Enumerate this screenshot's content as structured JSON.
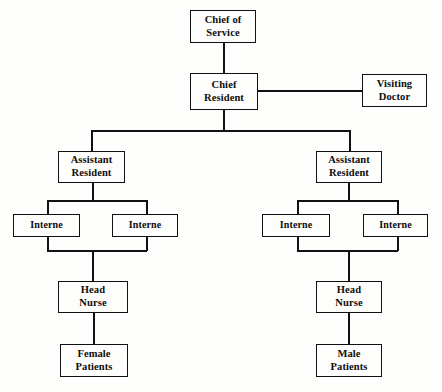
{
  "diagram": {
    "type": "org-chart",
    "canvas": {
      "width": 442,
      "height": 392
    },
    "line_color": "#111111",
    "box_fill": "#fdfdfb",
    "text_color": "#0d0d0d",
    "nodes": [
      {
        "id": "chief-of-service",
        "lines": [
          "Chief of",
          "Service"
        ],
        "x": 190,
        "y": 10,
        "w": 66,
        "h": 33
      },
      {
        "id": "chief-resident",
        "lines": [
          "Chief",
          "Resident"
        ],
        "x": 190,
        "y": 73,
        "w": 68,
        "h": 37
      },
      {
        "id": "visiting-doctor",
        "lines": [
          "Visiting",
          "Doctor"
        ],
        "x": 362,
        "y": 74,
        "w": 65,
        "h": 33
      },
      {
        "id": "assistant-resident-left",
        "lines": [
          "Assistant",
          "Resident"
        ],
        "x": 58,
        "y": 151,
        "w": 67,
        "h": 32
      },
      {
        "id": "assistant-resident-right",
        "lines": [
          "Assistant",
          "Resident"
        ],
        "x": 316,
        "y": 151,
        "w": 66,
        "h": 32
      },
      {
        "id": "interne-left-1",
        "lines": [
          "Interne"
        ],
        "x": 13,
        "y": 214,
        "w": 67,
        "h": 23
      },
      {
        "id": "interne-left-2",
        "lines": [
          "Interne"
        ],
        "x": 112,
        "y": 214,
        "w": 66,
        "h": 23
      },
      {
        "id": "interne-right-1",
        "lines": [
          "Interne"
        ],
        "x": 262,
        "y": 214,
        "w": 68,
        "h": 23
      },
      {
        "id": "interne-right-2",
        "lines": [
          "Interne"
        ],
        "x": 363,
        "y": 214,
        "w": 65,
        "h": 23
      },
      {
        "id": "head-nurse-left",
        "lines": [
          "Head",
          "Nurse"
        ],
        "x": 58,
        "y": 281,
        "w": 70,
        "h": 32
      },
      {
        "id": "head-nurse-right",
        "lines": [
          "Head",
          "Nurse"
        ],
        "x": 316,
        "y": 281,
        "w": 66,
        "h": 32
      },
      {
        "id": "female-patients",
        "lines": [
          "Female",
          "Patients"
        ],
        "x": 60,
        "y": 344,
        "w": 68,
        "h": 33
      },
      {
        "id": "male-patients",
        "lines": [
          "Male",
          "Patients"
        ],
        "x": 316,
        "y": 344,
        "w": 66,
        "h": 33
      }
    ],
    "edges": [
      {
        "id": "chief-service-to-chief-resident",
        "orient": "v",
        "x": 223,
        "y": 43,
        "len": 30
      },
      {
        "id": "chief-resident-to-visiting-doctor",
        "orient": "h",
        "x": 258,
        "y": 90,
        "len": 104
      },
      {
        "id": "chief-resident-stem-down",
        "orient": "v",
        "x": 223,
        "y": 110,
        "len": 21
      },
      {
        "id": "assistant-bus",
        "orient": "h",
        "x": 91,
        "y": 130,
        "len": 259
      },
      {
        "id": "assistant-left-drop",
        "orient": "v",
        "x": 91,
        "y": 130,
        "len": 21
      },
      {
        "id": "assistant-right-drop",
        "orient": "v",
        "x": 349,
        "y": 130,
        "len": 21
      },
      {
        "id": "assistant-left-stem",
        "orient": "v",
        "x": 92,
        "y": 183,
        "len": 18
      },
      {
        "id": "interne-left-top-bus",
        "orient": "h",
        "x": 47,
        "y": 200,
        "len": 100
      },
      {
        "id": "interne-left-1-drop",
        "orient": "v",
        "x": 47,
        "y": 200,
        "len": 15
      },
      {
        "id": "interne-left-2-drop",
        "orient": "v",
        "x": 146,
        "y": 200,
        "len": 15
      },
      {
        "id": "interne-left-1-riser",
        "orient": "v",
        "x": 47,
        "y": 237,
        "len": 14
      },
      {
        "id": "interne-left-2-riser",
        "orient": "v",
        "x": 146,
        "y": 237,
        "len": 14
      },
      {
        "id": "interne-left-bottom-bus",
        "orient": "h",
        "x": 47,
        "y": 250,
        "len": 100
      },
      {
        "id": "head-nurse-left-stem",
        "orient": "v",
        "x": 92,
        "y": 250,
        "len": 32
      },
      {
        "id": "female-patients-stem",
        "orient": "v",
        "x": 93,
        "y": 313,
        "len": 32
      },
      {
        "id": "assistant-right-stem",
        "orient": "v",
        "x": 348,
        "y": 183,
        "len": 18
      },
      {
        "id": "interne-right-top-bus",
        "orient": "h",
        "x": 297,
        "y": 200,
        "len": 101
      },
      {
        "id": "interne-right-1-drop",
        "orient": "v",
        "x": 297,
        "y": 200,
        "len": 15
      },
      {
        "id": "interne-right-2-drop",
        "orient": "v",
        "x": 397,
        "y": 200,
        "len": 15
      },
      {
        "id": "interne-right-1-riser",
        "orient": "v",
        "x": 297,
        "y": 237,
        "len": 14
      },
      {
        "id": "interne-right-2-riser",
        "orient": "v",
        "x": 397,
        "y": 237,
        "len": 14
      },
      {
        "id": "interne-right-bottom-bus",
        "orient": "h",
        "x": 297,
        "y": 250,
        "len": 101
      },
      {
        "id": "head-nurse-right-stem",
        "orient": "v",
        "x": 348,
        "y": 250,
        "len": 32
      },
      {
        "id": "male-patients-stem",
        "orient": "v",
        "x": 348,
        "y": 313,
        "len": 32
      }
    ]
  }
}
